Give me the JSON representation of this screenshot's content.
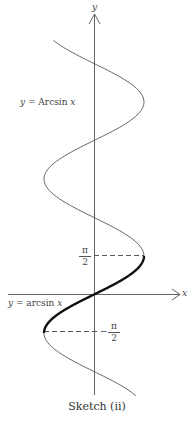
{
  "diagram": {
    "axis_x_label": "x",
    "axis_y_label": "y",
    "upper_label": {
      "lhs": "y",
      "eq": " = Arcsin ",
      "var": "x"
    },
    "lower_label": {
      "lhs": "y",
      "eq": " = arcsin ",
      "var": "x"
    },
    "tick_top": {
      "num": "π",
      "den": "2"
    },
    "tick_bottom": {
      "num": "π",
      "den": "2",
      "sign": "−"
    },
    "caption": "Sketch (ii)"
  }
}
